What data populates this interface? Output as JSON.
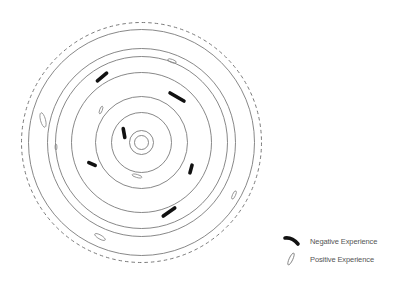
{
  "diagram": {
    "center": [
      141.5,
      142.5
    ],
    "outer_dashed_radius": 120,
    "ring_radii": [
      113,
      94,
      86,
      70,
      46,
      30,
      12,
      7
    ],
    "line_color": "#7a7a7a",
    "mark_color": "#111111",
    "negative_marks": [
      {
        "x": 102,
        "y": 77,
        "angle": -40,
        "len": 12
      },
      {
        "x": 177,
        "y": 97,
        "angle": 30,
        "len": 16
      },
      {
        "x": 124,
        "y": 133,
        "angle": 80,
        "len": 9
      },
      {
        "x": 92,
        "y": 164,
        "angle": 25,
        "len": 7
      },
      {
        "x": 191,
        "y": 169,
        "angle": -75,
        "len": 8
      },
      {
        "x": 169,
        "y": 212,
        "angle": -35,
        "len": 14
      }
    ],
    "positive_marks": [
      {
        "x": 172,
        "y": 61,
        "rx": 4.5,
        "ry": 1.6,
        "angle": 20
      },
      {
        "x": 101,
        "y": 110,
        "rx": 4,
        "ry": 1.3,
        "angle": -70
      },
      {
        "x": 43,
        "y": 120,
        "rx": 7.5,
        "ry": 2.5,
        "angle": 75
      },
      {
        "x": 56,
        "y": 147,
        "rx": 3,
        "ry": 1,
        "angle": 90
      },
      {
        "x": 137,
        "y": 176,
        "rx": 5,
        "ry": 1.5,
        "angle": 15
      },
      {
        "x": 234,
        "y": 195,
        "rx": 4.5,
        "ry": 1.5,
        "angle": -65
      },
      {
        "x": 100,
        "y": 237,
        "rx": 6,
        "ry": 2,
        "angle": 30
      }
    ]
  },
  "legend": {
    "negative_label": "Negative Experience",
    "positive_label": "Positive Experience"
  }
}
